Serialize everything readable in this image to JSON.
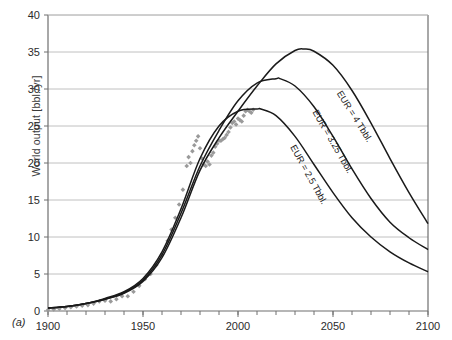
{
  "figure": {
    "panel_tag": "(a)",
    "y_axis_title": "World output [bbl./yr]"
  },
  "chart_data": {
    "type": "line",
    "title": "",
    "xlabel": "",
    "ylabel": "World output [bbl./yr]",
    "xlim": [
      1900,
      2100
    ],
    "ylim": [
      0,
      40
    ],
    "grid": "horizontal",
    "legend": "inline-annotations",
    "x_ticks_major": [
      1900,
      1950,
      2000,
      2050,
      2100
    ],
    "x_ticks_minor_step": 10,
    "y_ticks": [
      0,
      5,
      10,
      15,
      20,
      25,
      30,
      35,
      40
    ],
    "colors": {
      "curve": "#1a1a1a",
      "scatter": "#9a9a9a",
      "grid": "#b9b9b9",
      "axis": "#6e6e6e"
    },
    "series": [
      {
        "name": "EUR = 4 Tbbl.",
        "annotation": "EUR = 4 Tbbl.",
        "peak_year": 2035,
        "peak_value": 35.4,
        "value_at_2100": 11.8,
        "x": [
          1900,
          1910,
          1920,
          1930,
          1940,
          1950,
          1960,
          1970,
          1980,
          1990,
          2000,
          2010,
          2020,
          2030,
          2035,
          2040,
          2050,
          2060,
          2070,
          2080,
          2090,
          2100
        ],
        "values": [
          0.4,
          0.6,
          1.0,
          1.6,
          2.4,
          4.0,
          7.2,
          12.6,
          19.0,
          23.4,
          27.0,
          30.4,
          33.4,
          35.2,
          35.4,
          35.1,
          33.2,
          29.8,
          25.4,
          20.6,
          16.0,
          11.8
        ]
      },
      {
        "name": "EUR = 3.25 Tbbl.",
        "annotation": "EUR = 3.25 Tbbl.",
        "peak_year": 2022,
        "peak_value": 31.4,
        "value_at_2100": 8.3,
        "x": [
          1900,
          1910,
          1920,
          1930,
          1940,
          1950,
          1960,
          1970,
          1980,
          1990,
          2000,
          2010,
          2020,
          2022,
          2030,
          2040,
          2050,
          2060,
          2070,
          2080,
          2090,
          2100
        ],
        "values": [
          0.4,
          0.6,
          1.0,
          1.6,
          2.5,
          4.2,
          7.6,
          13.2,
          19.6,
          24.4,
          28.4,
          30.8,
          31.4,
          31.4,
          30.4,
          27.6,
          23.6,
          19.2,
          15.2,
          12.0,
          9.9,
          8.3
        ]
      },
      {
        "name": "EUR = 2.5 Tbbl.",
        "annotation": "EUR = 2.5 Tbbl.",
        "peak_year": 2012,
        "peak_value": 27.3,
        "value_at_2100": 5.3,
        "x": [
          1900,
          1910,
          1920,
          1930,
          1940,
          1950,
          1960,
          1970,
          1980,
          1990,
          2000,
          2010,
          2012,
          2020,
          2030,
          2040,
          2050,
          2060,
          2070,
          2080,
          2090,
          2100
        ],
        "values": [
          0.4,
          0.6,
          1.0,
          1.7,
          2.6,
          4.4,
          8.0,
          13.8,
          20.6,
          25.0,
          27.0,
          27.3,
          27.3,
          26.4,
          23.6,
          19.8,
          16.0,
          12.6,
          10.0,
          8.0,
          6.5,
          5.3
        ]
      }
    ],
    "scatter": {
      "name": "Historical world oil output",
      "marker": "diamond",
      "color": "#9a9a9a",
      "x": [
        1900,
        1903,
        1906,
        1909,
        1912,
        1915,
        1918,
        1921,
        1924,
        1927,
        1930,
        1933,
        1936,
        1939,
        1942,
        1945,
        1948,
        1951,
        1954,
        1957,
        1960,
        1963,
        1965,
        1967,
        1969,
        1971,
        1973,
        1974,
        1975,
        1976,
        1977,
        1978,
        1979,
        1980,
        1981,
        1982,
        1983,
        1984,
        1985,
        1986,
        1987,
        1988,
        1989,
        1990,
        1991,
        1992,
        1993,
        1994,
        1995,
        1996,
        1997,
        1998,
        1999,
        2000,
        2001,
        2002,
        2003,
        2004,
        2005,
        2006,
        2007,
        2008
      ],
      "values": [
        0.15,
        0.2,
        0.3,
        0.4,
        0.5,
        0.6,
        0.7,
        0.8,
        1.0,
        1.3,
        1.4,
        1.3,
        1.6,
        2.0,
        2.0,
        2.6,
        3.4,
        4.3,
        5.0,
        6.2,
        7.6,
        9.5,
        11.0,
        12.6,
        14.4,
        16.4,
        19.6,
        20.8,
        20.0,
        21.6,
        22.4,
        23.0,
        23.6,
        22.0,
        20.6,
        19.8,
        19.6,
        20.2,
        19.8,
        21.0,
        21.4,
        22.2,
        22.6,
        23.0,
        23.0,
        23.2,
        23.4,
        23.8,
        24.2,
        24.8,
        25.4,
        25.6,
        25.2,
        26.0,
        25.8,
        25.6,
        26.4,
        27.0,
        27.2,
        27.0,
        26.8,
        27.2
      ]
    }
  }
}
